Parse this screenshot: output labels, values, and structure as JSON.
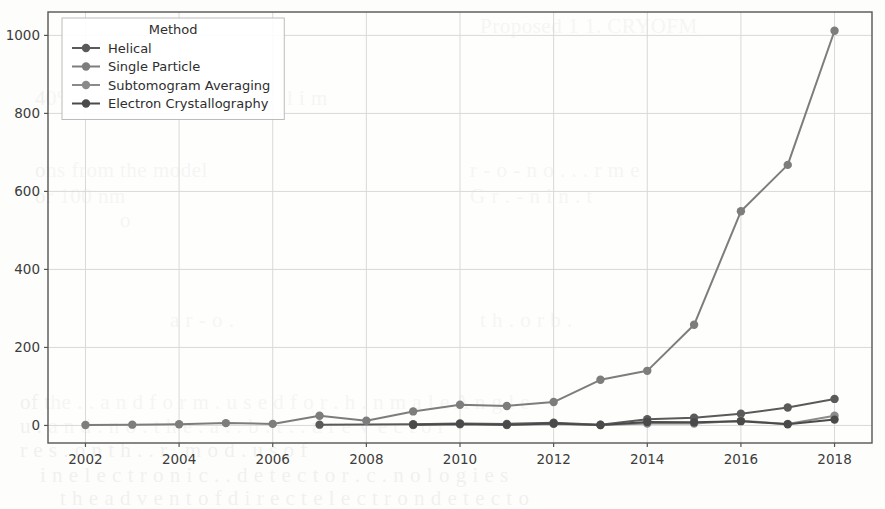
{
  "chart_data": {
    "type": "line",
    "title": "",
    "xlabel": "",
    "ylabel": "",
    "legend_title": "Method",
    "legend_position": "upper-left",
    "grid": true,
    "xlim": [
      2001.2,
      2018.8
    ],
    "ylim": [
      -45,
      1060
    ],
    "xticks": [
      2002,
      2004,
      2006,
      2008,
      2010,
      2012,
      2014,
      2016,
      2018
    ],
    "yticks": [
      0,
      200,
      400,
      600,
      800,
      1000
    ],
    "x": [
      2002,
      2003,
      2004,
      2005,
      2006,
      2007,
      2008,
      2009,
      2010,
      2011,
      2012,
      2013,
      2014,
      2015,
      2016,
      2017,
      2018
    ],
    "series": [
      {
        "name": "Helical",
        "color": "#5a5a5a",
        "values": [
          null,
          null,
          null,
          null,
          null,
          2,
          null,
          3,
          5,
          4,
          7,
          2,
          16,
          20,
          30,
          46,
          68
        ]
      },
      {
        "name": "Single Particle",
        "color": "#7d7d7d",
        "values": [
          1,
          2,
          3,
          6,
          4,
          25,
          12,
          36,
          53,
          50,
          60,
          117,
          140,
          258,
          549,
          668,
          1012
        ]
      },
      {
        "name": "Subtomogram Averaging",
        "color": "#8a8a8a",
        "values": [
          null,
          null,
          null,
          null,
          null,
          null,
          null,
          1,
          3,
          1,
          4,
          1,
          5,
          5,
          12,
          4,
          25
        ]
      },
      {
        "name": "Electron Crystallography",
        "color": "#4a4a4a",
        "values": [
          null,
          null,
          null,
          null,
          null,
          null,
          null,
          2,
          4,
          2,
          5,
          1,
          9,
          8,
          11,
          3,
          15
        ]
      }
    ]
  },
  "bleed_text": [
    {
      "text": "Proposed  1   1.  CRYOFM",
      "x": 480,
      "y": 6
    },
    {
      "text": "40% % o x 5 K   . r e x  5 K e l i m",
      "x": 35,
      "y": 78
    },
    {
      "text": "ons  from   the  model",
      "x": 35,
      "y": 150
    },
    {
      "text": "or  100 nm",
      "x": 35,
      "y": 176
    },
    {
      "text": "o",
      "x": 120,
      "y": 200
    },
    {
      "text": "r -  o  -  n  o  .  .  . r  m  e",
      "x": 470,
      "y": 150
    },
    {
      "text": "G r  .  -  n  i n   .  t",
      "x": 470,
      "y": 176
    },
    {
      "text": "a  r   -  o   .",
      "x": 170,
      "y": 300
    },
    {
      "text": "t h   .  o  r  b  .",
      "x": 480,
      "y": 300
    },
    {
      "text": "of  the  . . a n d  f o r m   . u s e d  f o r    . h .  n  m a l e  A n g l e",
      "x": 20,
      "y": 382
    },
    {
      "text": "u  .  a n d  .  n  o  .  t h e   . a  .  . b . t  .   . u r e  V e c t o r",
      "x": 20,
      "y": 406
    },
    {
      "text": "r e s   . o n  t h .  . r  . m o d . u s   o f",
      "x": 20,
      "y": 430
    },
    {
      "text": "i n   e  l e c t r o n   i c   .  .  d e t e c t o r   . c  .  n o l o g i e s",
      "x": 40,
      "y": 455
    },
    {
      "text": "t h e   a d v e n t   o f   d i r e c t   e l e c t r o n   d e t e c t o",
      "x": 60,
      "y": 478
    }
  ]
}
